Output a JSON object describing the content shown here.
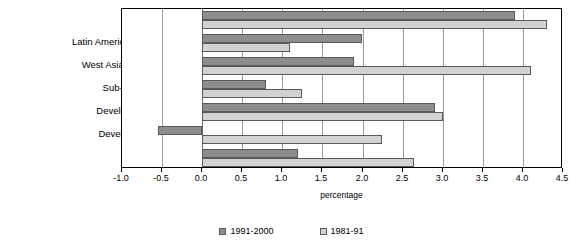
{
  "chart_data": {
    "type": "bar",
    "orientation": "horizontal",
    "title": "",
    "xlabel": "percentage",
    "ylabel": "",
    "xlim": [
      -1.0,
      4.5
    ],
    "xticks": [
      -1.0,
      -0.5,
      0.0,
      0.5,
      1.0,
      1.5,
      2.0,
      2.5,
      3.0,
      3.5,
      4.0,
      4.5
    ],
    "xtick_labels": [
      "-1.0",
      "-0.5",
      "0.0",
      "0.5",
      "1.0",
      "1.5",
      "2.0",
      "2.5",
      "3.0",
      "3.5",
      "4.0",
      "4.5"
    ],
    "grid": true,
    "legend_position": "bottom",
    "categories": [
      "Asia & Pacific",
      "Latin America & Caribbean",
      "West Asia & North Africa",
      "Sub-Saharan Africa",
      "Developing countries",
      "Developed countries",
      "Global total"
    ],
    "series": [
      {
        "name": "1991-2000",
        "color": "#8d8d8d",
        "values": [
          3.9,
          2.0,
          1.9,
          0.8,
          2.9,
          -0.55,
          1.2
        ]
      },
      {
        "name": "1981-91",
        "color": "#d2d2d2",
        "values": [
          4.3,
          1.1,
          4.1,
          1.25,
          3.0,
          2.25,
          2.65
        ]
      }
    ]
  },
  "legend": {
    "entries": [
      {
        "label": "1991-2000"
      },
      {
        "label": "1981-91"
      }
    ]
  }
}
